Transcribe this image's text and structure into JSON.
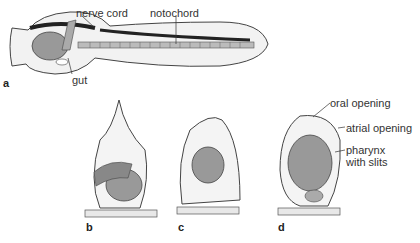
{
  "figure": {
    "panels": [
      {
        "id": "a",
        "label": "a",
        "description": "tunicate larva, lateral view"
      },
      {
        "id": "b",
        "label": "b",
        "description": "settling larva attached to substrate"
      },
      {
        "id": "c",
        "label": "c",
        "description": "metamorphosing juvenile"
      },
      {
        "id": "d",
        "label": "d",
        "description": "adult sessile tunicate"
      }
    ],
    "annotations": {
      "nerve_cord": "nerve cord",
      "notochord": "notochord",
      "gut": "gut",
      "oral_opening": "oral opening",
      "atrial_opening": "atrial opening",
      "pharynx_line1": "pharynx",
      "pharynx_line2": "with slits"
    }
  }
}
